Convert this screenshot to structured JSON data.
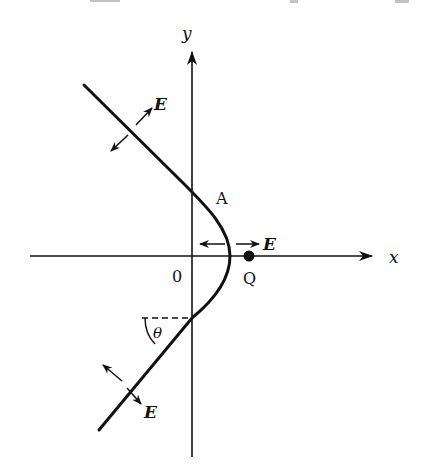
{
  "diagram": {
    "axes": {
      "x_label": "x",
      "y_label": "y",
      "origin_label": "0"
    },
    "labels": {
      "point_a": "A",
      "point_q": "Q",
      "angle": "θ",
      "field_top": "E",
      "field_vertex": "E",
      "field_bottom": "E"
    },
    "colors": {
      "stroke": "#111111",
      "background": "#ffffff"
    }
  }
}
